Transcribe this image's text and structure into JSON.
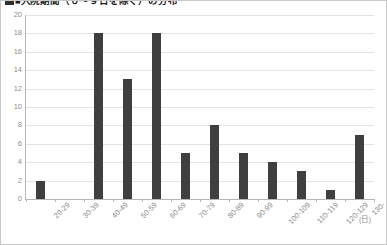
{
  "chart_data": {
    "type": "bar",
    "title": "■入院期間（０～９日を除く）の分布",
    "categories": [
      "20-29",
      "30-39",
      "40-49",
      "50-59",
      "60-69",
      "70-79",
      "80-89",
      "90-99",
      "100-109",
      "110-119",
      "120-129",
      "130-"
    ],
    "values": [
      2,
      0,
      18,
      13,
      18,
      5,
      8,
      5,
      4,
      3,
      1,
      7
    ],
    "xlabel": "(日)",
    "ylabel": "",
    "ylim": [
      0,
      20
    ],
    "yticks": [
      0,
      2,
      4,
      6,
      8,
      10,
      12,
      14,
      16,
      18,
      20
    ],
    "ytick_labels": [
      "0",
      "2",
      "4",
      "6",
      "8",
      "10",
      "12",
      "14",
      "16",
      "18",
      "20"
    ],
    "grid": true,
    "legend": false,
    "series": [
      {
        "name": "件数",
        "values": [
          2,
          0,
          18,
          13,
          18,
          5,
          8,
          5,
          4,
          3,
          1,
          7
        ]
      }
    ],
    "colors": {
      "bar": "#3f3f3f",
      "gridline": "#e4e4e4",
      "axis": "#b6b6b6",
      "tick_text": "#8d8d8d",
      "title_text": "#1a1a1a",
      "background": "#ffffff",
      "border": "#c9c9c9"
    }
  }
}
